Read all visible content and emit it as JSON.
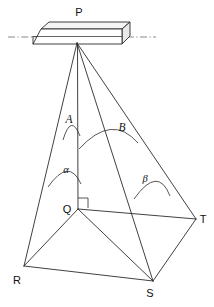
{
  "figure": {
    "type": "geometry-diagram",
    "stroke_color": "#2b2b2b",
    "axis_color": "#6a6a6a",
    "background": "#ffffff"
  },
  "vertices": [
    {
      "id": "P",
      "label": "P",
      "x": 77,
      "y": 43,
      "label_x": 79,
      "label_y": 16,
      "role": "apex"
    },
    {
      "id": "Q",
      "label": "Q",
      "x": 78,
      "y": 209,
      "label_x": 67,
      "label_y": 213,
      "role": "base-foot"
    },
    {
      "id": "R",
      "label": "R",
      "x": 24,
      "y": 266,
      "label_x": 17,
      "label_y": 284,
      "role": "base-corner"
    },
    {
      "id": "S",
      "label": "S",
      "x": 153,
      "y": 281,
      "label_x": 150,
      "label_y": 297,
      "role": "base-corner"
    },
    {
      "id": "T",
      "label": "T",
      "x": 196,
      "y": 219,
      "label_x": 203,
      "label_y": 223,
      "role": "base-corner"
    }
  ],
  "angle_labels": [
    {
      "id": "A",
      "label": "A",
      "x": 69,
      "y": 123,
      "style": "italic-latin"
    },
    {
      "id": "B",
      "label": "B",
      "x": 122,
      "y": 131,
      "style": "italic-latin"
    },
    {
      "id": "alpha",
      "label": "α",
      "x": 66,
      "y": 173,
      "style": "italic-greek"
    },
    {
      "id": "beta",
      "label": "β",
      "x": 145,
      "y": 182,
      "style": "italic-greek"
    }
  ],
  "edges": [
    {
      "from": "P",
      "to": "R",
      "name": "edge-pr"
    },
    {
      "from": "P",
      "to": "Q",
      "name": "edge-pq-vertical"
    },
    {
      "from": "P",
      "to": "S",
      "name": "edge-ps"
    },
    {
      "from": "P",
      "to": "T",
      "name": "edge-pt"
    },
    {
      "from": "Q",
      "to": "R",
      "name": "edge-qr"
    },
    {
      "from": "Q",
      "to": "T",
      "name": "edge-qt"
    },
    {
      "from": "Q",
      "to": "S",
      "name": "edge-qs"
    },
    {
      "from": "R",
      "to": "S",
      "name": "edge-rs"
    },
    {
      "from": "S",
      "to": "T",
      "name": "edge-st"
    }
  ],
  "slab": {
    "name": "ceiling-plate",
    "front_face": "33,44 41,29 122,29 114,44",
    "top_face": "41,29 49,22 130,22 122,29",
    "side_face": "122,29 130,22 130,36 122,44",
    "inner_line": "33,36 114,36"
  },
  "axis": {
    "name": "horizontal-reference-line",
    "x1": 8,
    "y1": 37,
    "x2": 156,
    "y2": 37
  },
  "right_angle": {
    "name": "right-angle-mark-at-q",
    "path": "M 78 198 L 88 198 L 88 208"
  },
  "arcs": [
    {
      "id": "arc-A",
      "path": "M 63 140 Q 71 113 80 136",
      "label": "A"
    },
    {
      "id": "arc-B",
      "path": "M 79 149 Q 112 113 138 143",
      "label": "B"
    },
    {
      "id": "arc-alpha",
      "path": "M 48 187 Q 70 158 81 184",
      "label": "α"
    },
    {
      "id": "arc-beta",
      "path": "M 134 199 Q 158 165 170 196",
      "label": "β"
    }
  ]
}
